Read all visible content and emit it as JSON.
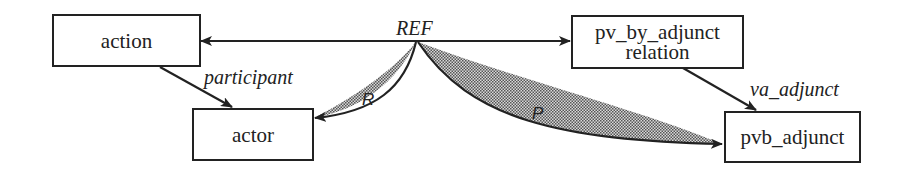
{
  "diagram": {
    "nodes": {
      "action": {
        "label": "action"
      },
      "actor": {
        "label": "actor"
      },
      "pv_by_adjunct_relation": {
        "line1": "pv_by_adjunct",
        "line2": "relation"
      },
      "pvb_adjunct": {
        "label": "pvb_adjunct"
      }
    },
    "edges": {
      "ref": {
        "label": "REF",
        "from": "REF",
        "to": [
          "action",
          "pv_by_adjunct_relation"
        ],
        "style": "double-headed arrow"
      },
      "participant": {
        "label": "participant",
        "from": "action",
        "to": "actor"
      },
      "va_adjunct": {
        "label": "va_adjunct",
        "from": "pv_by_adjunct_relation",
        "to": "pvb_adjunct"
      },
      "r": {
        "label": "R",
        "from": "REF",
        "to": "actor",
        "style": "shaded curved wedge"
      },
      "p": {
        "label": "P",
        "from": "REF",
        "to": "pvb_adjunct",
        "style": "shaded curved wedge"
      }
    },
    "colors": {
      "stroke": "#222222",
      "shade": "#9a9a9a",
      "background": "#ffffff"
    }
  }
}
